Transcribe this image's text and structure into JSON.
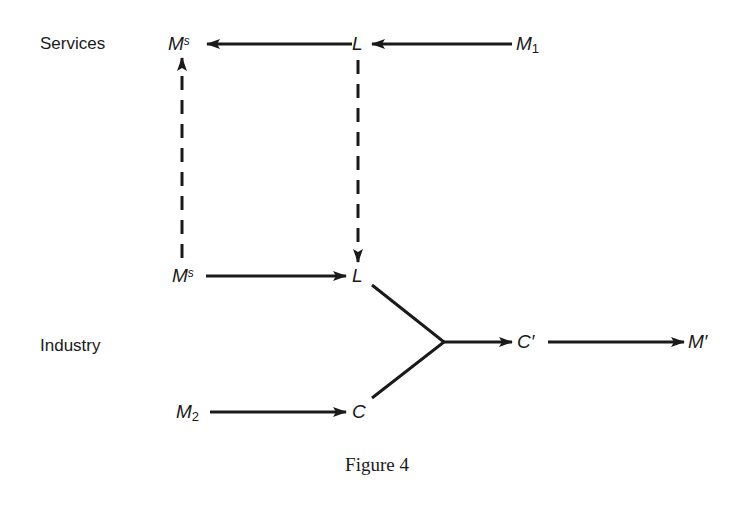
{
  "rows": {
    "services_label": "Services",
    "industry_label": "Industry"
  },
  "nodes": {
    "ms_top": {
      "base": "M",
      "sup": "s"
    },
    "l_top": {
      "base": "L"
    },
    "m1": {
      "base": "M",
      "sub": "1"
    },
    "ms_bottom": {
      "base": "M",
      "sup": "s"
    },
    "l_bottom": {
      "base": "L"
    },
    "m2": {
      "base": "M",
      "sub": "2"
    },
    "c": {
      "base": "C"
    },
    "c_prime": {
      "base": "C′"
    },
    "m_prime": {
      "base": "M′"
    }
  },
  "edges": [
    {
      "from": "M1",
      "to": "L (services)",
      "style": "solid"
    },
    {
      "from": "L (services)",
      "to": "Ms (services)",
      "style": "solid"
    },
    {
      "from": "Ms (industry)",
      "to": "Ms (services)",
      "style": "dashed"
    },
    {
      "from": "L (services)",
      "to": "L (industry)",
      "style": "dashed"
    },
    {
      "from": "Ms (industry)",
      "to": "L (industry)",
      "style": "solid"
    },
    {
      "from": "M2",
      "to": "C",
      "style": "solid"
    },
    {
      "from": "L (industry) + C",
      "to": "C′",
      "style": "solid-merge"
    },
    {
      "from": "C′",
      "to": "M′",
      "style": "solid"
    }
  ],
  "caption": "Figure 4",
  "colors": {
    "ink": "#1a1a1a",
    "background": "#ffffff"
  }
}
